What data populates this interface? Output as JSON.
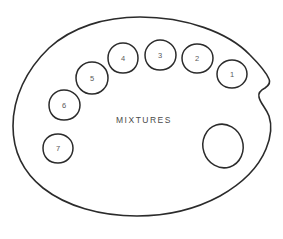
{
  "figure": {
    "name": "artist-paint-palette-diagram",
    "caption": "MIXTURES",
    "background_color": "#ffffff",
    "line_color": "#2b2b2b",
    "text_color": "#4a4a4a"
  },
  "palette": {
    "outline_name": "palette-outline",
    "thumb_hole_name": "thumb-hole",
    "thumb_notch_name": "thumb-notch"
  },
  "wells": [
    {
      "label": "1",
      "cx": 232,
      "cy": 74
    },
    {
      "label": "2",
      "cx": 197,
      "cy": 58
    },
    {
      "label": "3",
      "cx": 160,
      "cy": 55
    },
    {
      "label": "4",
      "cx": 123,
      "cy": 58
    },
    {
      "label": "5",
      "cx": 92,
      "cy": 78
    },
    {
      "label": "6",
      "cx": 64,
      "cy": 105
    },
    {
      "label": "7",
      "cx": 58,
      "cy": 148
    }
  ],
  "caption_position": {
    "x": 144,
    "y": 121
  }
}
